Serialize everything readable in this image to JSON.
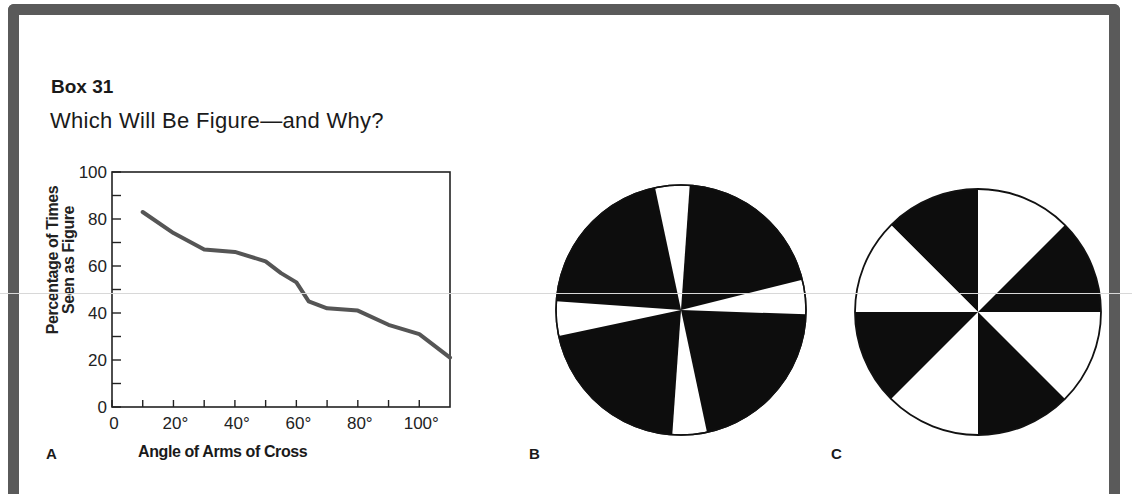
{
  "box": {
    "label": "Box 31",
    "title": "Which Will Be Figure—and Why?",
    "frame_color": "#5a5a5a"
  },
  "panels": {
    "a": {
      "letter": "A"
    },
    "b": {
      "letter": "B",
      "description": "Circle with a thin white cross on black background (narrow-armed white cross)"
    },
    "c": {
      "letter": "C",
      "description": "Circle divided into eight equal alternating black and white sectors"
    }
  },
  "chart_data": {
    "type": "line",
    "title": "",
    "xlabel": "Angle of Arms of Cross",
    "ylabel": "Percentage of Times Seen as Figure",
    "ylabel_lines": [
      "Percentage of Times",
      "Seen as Figure"
    ],
    "xlim": [
      0,
      110
    ],
    "ylim": [
      0,
      100
    ],
    "x_ticks": [
      0,
      10,
      20,
      30,
      40,
      50,
      60,
      70,
      80,
      90,
      100
    ],
    "x_tick_labels": [
      "0",
      "20°",
      "40°",
      "60°",
      "80°",
      "100°"
    ],
    "x_tick_label_values": [
      0,
      20,
      40,
      60,
      80,
      100
    ],
    "y_ticks": [
      0,
      10,
      20,
      30,
      40,
      50,
      60,
      70,
      80,
      90,
      100
    ],
    "y_tick_labels": [
      "0",
      "20",
      "40",
      "60",
      "80",
      "100"
    ],
    "y_tick_label_values": [
      0,
      20,
      40,
      60,
      80,
      100
    ],
    "grid": false,
    "legend": null,
    "series": [
      {
        "name": "Percentage seen as figure",
        "color": "#555555",
        "x": [
          10,
          20,
          30,
          40,
          50,
          55,
          60,
          64,
          70,
          80,
          90,
          100,
          110
        ],
        "y": [
          83,
          74,
          67,
          66,
          62,
          57,
          53,
          45,
          42,
          41,
          35,
          31,
          21
        ]
      }
    ]
  }
}
